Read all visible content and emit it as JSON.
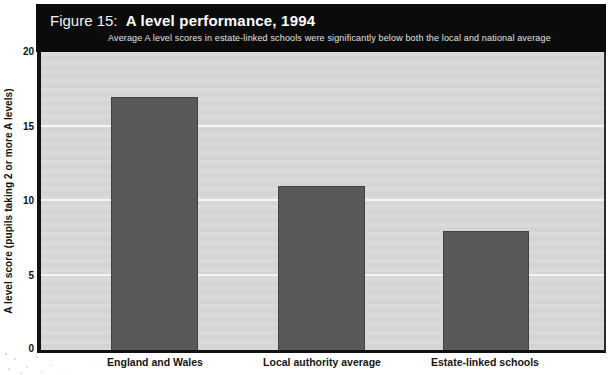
{
  "figure": {
    "label_prefix": "Figure 15:",
    "title": "A level performance, 1994",
    "subtitle": "Average A level scores in estate-linked schools were significantly below both the local and national average"
  },
  "colors": {
    "header_bg": "#0b0b0b",
    "header_text": "#ffffff",
    "plot_bg": "#d8d8d8",
    "gridline": "#f7f7f5",
    "bar": "#595959",
    "axis": "#121212"
  },
  "chart_data": {
    "type": "bar",
    "categories": [
      "England and Wales",
      "Local authority average",
      "Estate-linked schools"
    ],
    "values": [
      17,
      11,
      8
    ],
    "title": "A level performance, 1994",
    "xlabel": "",
    "ylabel": "A level score (pupils taking 2 or more A levels)",
    "ylim": [
      0,
      20
    ],
    "y_ticks": [
      20,
      15,
      10,
      5,
      0
    ],
    "gridlines_at": [
      5,
      10,
      15
    ],
    "grid": "horizontal-only",
    "legend": "none"
  }
}
